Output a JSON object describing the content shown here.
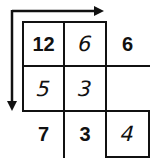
{
  "diagram": {
    "arrows": [
      {
        "name": "horizontal-arrow",
        "direction": "right"
      },
      {
        "name": "vertical-arrow",
        "direction": "down"
      }
    ],
    "grid": {
      "rows": [
        [
          {
            "value": "12",
            "style": "printed"
          },
          {
            "value": "6",
            "style": "handwritten"
          },
          {
            "value": "6",
            "style": "printed"
          }
        ],
        [
          {
            "value": "5",
            "style": "handwritten"
          },
          {
            "value": "3",
            "style": "handwritten"
          },
          {
            "value": "",
            "style": "empty"
          }
        ],
        [
          {
            "value": "7",
            "style": "printed"
          },
          {
            "value": "3",
            "style": "printed"
          },
          {
            "value": "4",
            "style": "handwritten"
          }
        ]
      ]
    },
    "colors": {
      "ink": "#111111",
      "background": "#ffffff"
    }
  }
}
